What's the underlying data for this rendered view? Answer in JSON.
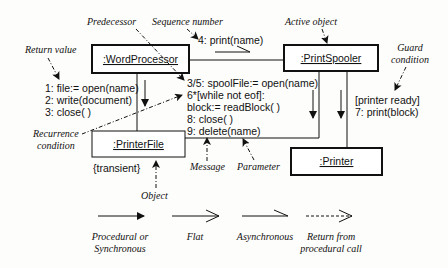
{
  "objects": {
    "word_processor": ":WordProcessor",
    "print_spooler": ":PrintSpooler",
    "printer_file": ":PrinterFile",
    "printer": ":Printer"
  },
  "constraints": {
    "printer_file": "{transient}"
  },
  "messages": {
    "wp_to_file": [
      "1: file:= open(name)",
      "2: write(document)",
      "3: close( )"
    ],
    "wp_to_spooler": "4: print(name)",
    "spooler_to_file": [
      "3/5: spoolFile:= open(name)",
      "6*[while not eof]:",
      "block:= readBlock( )",
      "8: close( )",
      "9: delete(name)"
    ],
    "spooler_to_printer": [
      "[printer ready]",
      "7: print(block)"
    ]
  },
  "annotations": {
    "predecessor": "Predecessor",
    "sequence_number": "Sequence number",
    "active_object": "Active object",
    "return_value": "Return value",
    "guard_condition": [
      "Guard",
      "condition"
    ],
    "recurrence_condition": [
      "Recurrence",
      "condition"
    ],
    "message": "Message",
    "parameter": "Parameter",
    "object": "Object"
  },
  "legend": [
    {
      "type": "procedural",
      "label": [
        "Procedural or",
        "Synchronous"
      ]
    },
    {
      "type": "flat",
      "label": [
        "Flat"
      ]
    },
    {
      "type": "asynchronous",
      "label": [
        "Asynchronous"
      ]
    },
    {
      "type": "return",
      "label": [
        "Return from",
        "procedural call"
      ]
    }
  ],
  "colors": {
    "ink": "#111111",
    "background": "#fdfdfb"
  }
}
